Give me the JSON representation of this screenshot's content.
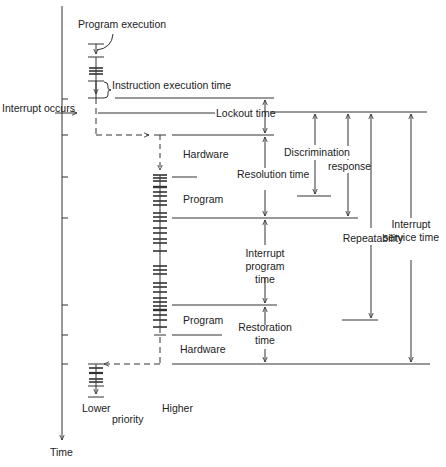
{
  "axis": {
    "label": "Time",
    "interrupt_marker": "Interrupt occurs"
  },
  "labels": {
    "program_execution": "Program execution",
    "instruction_execution_time": "Instruction execution time",
    "lockout_time": "Lockout time",
    "hardware_top": "Hardware",
    "program_top": "Program",
    "resolution_time": "Resolution time",
    "discrimination": "Discrimination",
    "response": "response",
    "repeatability": "Repeatability",
    "interrupt_service_time": "Interrupt service time",
    "interrupt_program_time": "Interrupt program time",
    "program_bottom": "Program",
    "restoration_time": "Restoration time",
    "hardware_bottom": "Hardware",
    "lower": "Lower",
    "priority": "priority",
    "higher": "Higher"
  },
  "colors": {
    "line": "#333333",
    "text": "#222222",
    "background": "#ffffff"
  }
}
